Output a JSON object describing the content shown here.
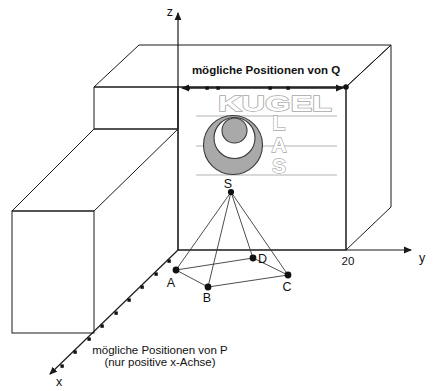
{
  "diagram": {
    "axis_labels": {
      "x": "x",
      "y": "y",
      "z": "z"
    },
    "y_axis_tick": "20",
    "q_annotation": "mögliche Positionen von Q",
    "p_annotation_line1": "mögliche Positionen von P",
    "p_annotation_line2": "(nur positive x-Achse)",
    "logo": {
      "horizontal_word": "KUGEL",
      "vertical_letters": {
        "l1": "L",
        "l2": "A",
        "l3": "S"
      }
    },
    "pyramid_labels": {
      "apex": "S",
      "a": "A",
      "b": "B",
      "c": "C",
      "d": "D"
    },
    "colors": {
      "face_gray": "#7d7d7d",
      "sphere_gray": "#a9a9a9",
      "logo_outline": "#a8a8a8"
    }
  }
}
